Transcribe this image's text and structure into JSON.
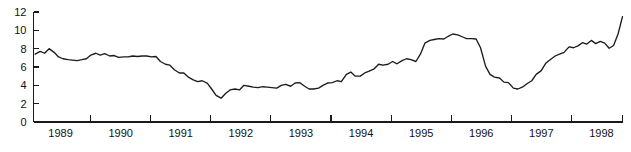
{
  "chart_data": {
    "type": "line",
    "title": "",
    "subtitle": "",
    "xlabel": "",
    "ylabel": "",
    "xlim": [
      1988.55,
      1998.35
    ],
    "ylim": [
      0,
      12
    ],
    "grid": false,
    "legend": null,
    "y_ticks": [
      0,
      2,
      4,
      6,
      8,
      10,
      12
    ],
    "y_tick_labels": [
      "0",
      "2",
      "4",
      "6",
      "8",
      "10",
      "12"
    ],
    "x_tick_labels": [
      "1989",
      "1990",
      "1991",
      "1992",
      "1993",
      "1994",
      "1995",
      "1996",
      "1997",
      "1998"
    ],
    "x_tick_positions": [
      1989,
      1990,
      1991,
      1992,
      1993,
      1994,
      1995,
      1996,
      1997,
      1998
    ],
    "x_tick_mark_positions": [
      1989.5,
      1990.5,
      1991.5,
      1992.5,
      1993.5,
      1994.5,
      1995.5,
      1996.5,
      1997.5,
      1998.35
    ],
    "series": [
      {
        "name": "series-1",
        "color": "#1c1c1c",
        "x": [
          1988.58,
          1988.67,
          1988.75,
          1988.83,
          1988.92,
          1989.0,
          1989.08,
          1989.17,
          1989.25,
          1989.33,
          1989.42,
          1989.5,
          1989.58,
          1989.67,
          1989.75,
          1989.83,
          1989.92,
          1990.0,
          1990.08,
          1990.17,
          1990.25,
          1990.33,
          1990.42,
          1990.5,
          1990.58,
          1990.67,
          1990.75,
          1990.83,
          1990.92,
          1991.0,
          1991.08,
          1991.17,
          1991.25,
          1991.33,
          1991.42,
          1991.5,
          1991.58,
          1991.67,
          1991.75,
          1991.83,
          1991.92,
          1992.0,
          1992.08,
          1992.17,
          1992.25,
          1992.33,
          1992.42,
          1992.5,
          1992.58,
          1992.67,
          1992.75,
          1992.83,
          1992.92,
          1993.0,
          1993.08,
          1993.17,
          1993.25,
          1993.33,
          1993.42,
          1993.5,
          1993.58,
          1993.67,
          1993.75,
          1993.83,
          1993.92,
          1994.0,
          1994.08,
          1994.17,
          1994.25,
          1994.33,
          1994.42,
          1994.5,
          1994.58,
          1994.67,
          1994.75,
          1994.83,
          1994.92,
          1995.0,
          1995.08,
          1995.17,
          1995.25,
          1995.33,
          1995.42,
          1995.5,
          1995.58,
          1995.67,
          1995.75,
          1995.83,
          1995.92,
          1996.0,
          1996.08,
          1996.17,
          1996.25,
          1996.33,
          1996.42,
          1996.5,
          1996.58,
          1996.67,
          1996.75,
          1996.83,
          1996.92,
          1997.0,
          1997.08,
          1997.17,
          1997.25,
          1997.33,
          1997.42,
          1997.5,
          1997.58,
          1997.67,
          1997.75,
          1997.83,
          1997.92,
          1998.0,
          1998.08,
          1998.17,
          1998.25,
          1998.33
        ],
        "y": [
          7.4,
          7.7,
          7.5,
          8.0,
          7.6,
          7.1,
          6.9,
          6.8,
          6.75,
          6.7,
          6.8,
          6.9,
          7.3,
          7.5,
          7.3,
          7.45,
          7.2,
          7.25,
          7.05,
          7.1,
          7.1,
          7.2,
          7.15,
          7.2,
          7.2,
          7.1,
          7.15,
          6.6,
          6.3,
          6.2,
          5.7,
          5.35,
          5.35,
          4.9,
          4.6,
          4.4,
          4.5,
          4.25,
          3.6,
          2.9,
          2.6,
          3.1,
          3.5,
          3.6,
          3.5,
          4.0,
          3.9,
          3.8,
          3.75,
          3.85,
          3.8,
          3.75,
          3.7,
          4.0,
          4.1,
          3.9,
          4.25,
          4.3,
          3.9,
          3.6,
          3.6,
          3.7,
          4.0,
          4.25,
          4.3,
          4.5,
          4.4,
          5.2,
          5.45,
          5.0,
          5.0,
          5.35,
          5.55,
          5.8,
          6.3,
          6.2,
          6.3,
          6.6,
          6.35,
          6.7,
          6.9,
          6.8,
          6.6,
          7.4,
          8.6,
          8.9,
          9.0,
          9.1,
          9.05,
          9.35,
          9.6,
          9.5,
          9.3,
          9.1,
          9.1,
          9.05,
          8.1,
          6.1,
          5.2,
          4.9,
          4.8,
          4.35,
          4.3,
          3.7,
          3.6,
          3.8,
          4.2,
          4.5,
          5.2,
          5.6,
          6.4,
          6.8,
          7.2,
          7.4,
          7.6,
          8.2,
          8.1,
          8.3
        ]
      }
    ],
    "annotations": [],
    "extra_y": [
      8.3,
      8.65,
      8.5,
      8.9,
      8.55,
      8.8,
      8.6,
      8.05,
      8.35,
      9.6,
      11.5
    ],
    "colors": {
      "line": "#1c1c1c",
      "axis": "#1a1a1a",
      "background": "#ffffff",
      "text": "#111111"
    }
  }
}
